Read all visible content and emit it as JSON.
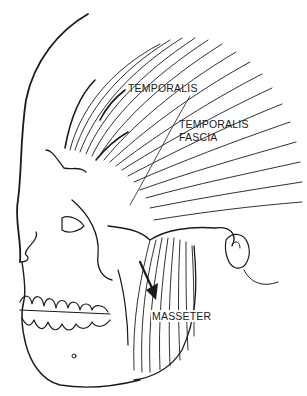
{
  "figure": {
    "labels": {
      "temporalis": "TEMPORALIS",
      "temporalis_fascia_line1": "TEMPORALIS",
      "temporalis_fascia_line2": "FASCIA",
      "masseter": "MASSETER"
    },
    "colors": {
      "background": "#ffffff",
      "ink": "#1a1a1a"
    }
  }
}
